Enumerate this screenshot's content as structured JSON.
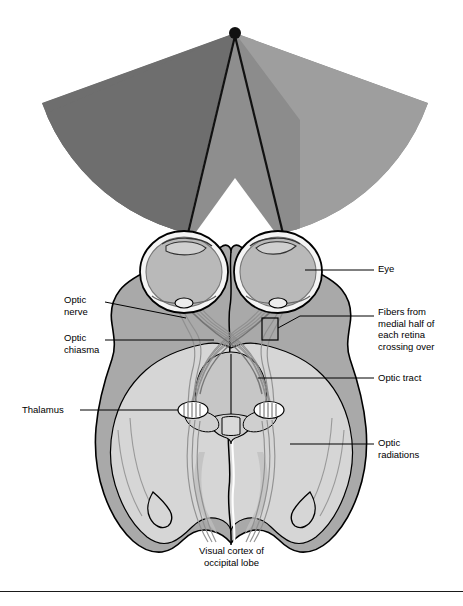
{
  "figure": {
    "fixation_point_label": "fixation-point"
  },
  "visual_field": {
    "apex": {
      "x": 235,
      "y": 33
    },
    "radius": 205,
    "start_angle_deg": 200,
    "end_angle_deg": 340,
    "colors": {
      "left_field_dark": "#6e6e6e",
      "mid_gray": "#8c8c8c",
      "right_field_light": "#9e9e9e",
      "overlap_gray": "#8a8a8a",
      "background": "#ffffff"
    }
  },
  "anatomy": {
    "colors": {
      "outline": "#000000",
      "temporal_lobe": "#a9a9a9",
      "occipital_lobe": "#d4d4d4",
      "brainstem": "#bdbdbd",
      "eye_sclera": "#f2f2f2",
      "eye_interior": "#b8b8b8",
      "nerve_fiber": "#8f8f8f",
      "lgn_oval": "#ffffff"
    }
  },
  "labels": {
    "eye": {
      "text": "Eye",
      "x": 380,
      "y": 268,
      "side": "right"
    },
    "optic_nerve": {
      "text": "Optic\nnerve",
      "x": 68,
      "y": 300,
      "side": "left"
    },
    "optic_chiasma": {
      "text": "Optic\nchiasma",
      "x": 68,
      "y": 330,
      "side": "left"
    },
    "thalamus": {
      "text": "Thalamus",
      "x": 24,
      "y": 401,
      "side": "left"
    },
    "fibers_crossing": {
      "text": "Fibers from\nmedial half of\neach retina\ncrossing over",
      "x": 380,
      "y": 311,
      "side": "right"
    },
    "optic_tract": {
      "text": "Optic tract",
      "x": 380,
      "y": 374,
      "side": "right"
    },
    "optic_radiations": {
      "text": "Optic\nradiations",
      "x": 380,
      "y": 440,
      "side": "right"
    }
  },
  "caption": {
    "line1": "Visual cortex of",
    "line2": "occipital lobe",
    "y": 548
  }
}
